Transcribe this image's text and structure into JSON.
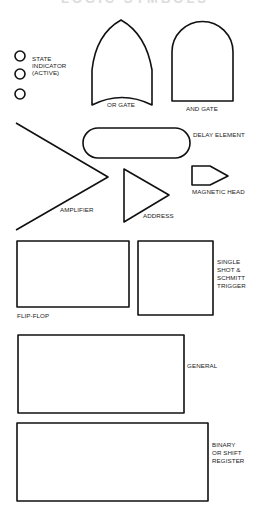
{
  "title": {
    "text": "LOGIC SYMBOLS",
    "visible": "clipped-at-top"
  },
  "colors": {
    "stroke": "#111111",
    "background": "#ffffff",
    "text": "#1a1a1a"
  },
  "symbols": {
    "state_indicator": {
      "label": "STATE\nINDICATOR\n(ACTIVE)",
      "lines": [
        "STATE",
        "INDICATOR",
        "(ACTIVE)"
      ],
      "count": 3
    },
    "or_gate": {
      "label": "OR GATE"
    },
    "and_gate": {
      "label": "AND GATE"
    },
    "amplifier": {
      "label": "AMPLIFIER"
    },
    "delay_element": {
      "label": "DELAY ELEMENT"
    },
    "address": {
      "label": "ADDRESS"
    },
    "magnetic_head": {
      "label": "MAGNETIC HEAD"
    },
    "flip_flop": {
      "label": "FLIP-FLOP"
    },
    "single_shot": {
      "lines": [
        "SINGLE",
        "SHOT &",
        "SCHMITT",
        "TRIGGER"
      ]
    },
    "general": {
      "label": "GENERAL"
    },
    "binary_register": {
      "lines": [
        "BINARY",
        "OR SHIFT",
        "REGISTER"
      ]
    }
  }
}
